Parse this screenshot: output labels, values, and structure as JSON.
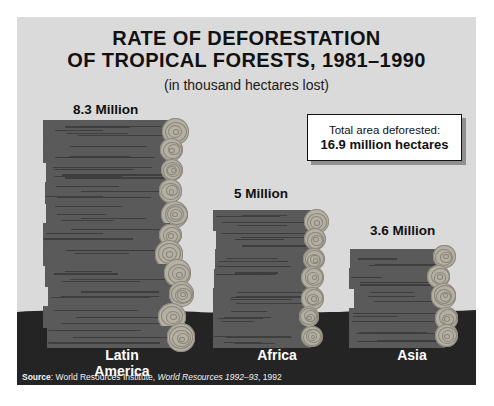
{
  "chart_data": {
    "type": "bar",
    "title_line1": "RATE OF DEFORESTATION",
    "title_line2": "OF TROPICAL FORESTS, 1981–1990",
    "subtitle": "(in thousand hectares lost)",
    "xlabel": "",
    "ylabel": "",
    "categories": [
      "Latin America",
      "Africa",
      "Asia"
    ],
    "values": [
      8.3,
      5,
      3.6
    ],
    "value_labels": [
      "8.3 Million",
      "5 Million",
      "3.6 Million"
    ],
    "unit": "million hectares per year",
    "ylim": [
      0,
      8.3
    ],
    "grid": false,
    "legend": false,
    "annotation": {
      "line1": "Total area deforested:",
      "line2": "16.9 million hectares",
      "total": 16.9
    },
    "style": "pictorial bar chart made of stacked logs on dark ground"
  },
  "source": {
    "prefix": "Source",
    "separator": ": ",
    "publisher": "World Resources Institute, ",
    "work_italic": "World Resources 1992–93",
    "year": ", 1992"
  },
  "categories_display": [
    {
      "line1": "Latin",
      "line2": "America"
    },
    {
      "line1": "Africa",
      "line2": ""
    },
    {
      "line1": "Asia",
      "line2": ""
    }
  ],
  "colors": {
    "panel_background": "#dadada",
    "log_body": "#5a5a5a",
    "log_grain": "#3a3a3a",
    "log_end_disc": "#b5b0a4",
    "ground": "#242424",
    "title_text": "#111111",
    "category_text": "#ffffff",
    "callout_background": "#ffffff",
    "callout_border": "#111111"
  }
}
